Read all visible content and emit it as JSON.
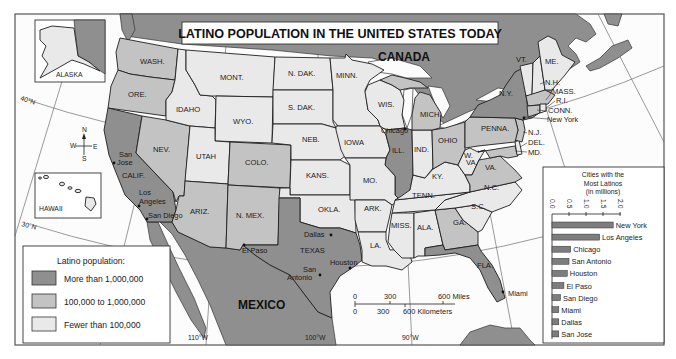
{
  "map": {
    "title": "LATINO POPULATION IN THE UNITED STATES TODAY",
    "countries": {
      "canada": "CANADA",
      "mexico": "MEXICO"
    },
    "insets": {
      "alaska": "ALASKA",
      "hawaii": "HAWAII"
    },
    "compass": {
      "n": "N",
      "s": "S",
      "e": "E",
      "w": "W"
    },
    "graticule": {
      "lat40": "40°N",
      "lat30": "30°N",
      "lon110": "110°W",
      "lon100": "100°W",
      "lon90": "90°W"
    },
    "states": {
      "WA": {
        "label": "WASH.",
        "category": "medium"
      },
      "OR": {
        "label": "ORE.",
        "category": "medium"
      },
      "CA": {
        "label": "CALIF.",
        "category": "high"
      },
      "NV": {
        "label": "NEV.",
        "category": "medium"
      },
      "ID": {
        "label": "IDAHO",
        "category": "low"
      },
      "MT": {
        "label": "MONT.",
        "category": "low"
      },
      "WY": {
        "label": "WYO.",
        "category": "low"
      },
      "UT": {
        "label": "UTAH",
        "category": "low"
      },
      "CO": {
        "label": "COLO.",
        "category": "medium"
      },
      "AZ": {
        "label": "ARIZ.",
        "category": "medium"
      },
      "NM": {
        "label": "N. MEX.",
        "category": "medium"
      },
      "ND": {
        "label": "N. DAK.",
        "category": "low"
      },
      "SD": {
        "label": "S. DAK.",
        "category": "low"
      },
      "NE": {
        "label": "NEB.",
        "category": "low"
      },
      "KS": {
        "label": "KANS.",
        "category": "low"
      },
      "OK": {
        "label": "OKLA.",
        "category": "low"
      },
      "TX": {
        "label": "TEXAS",
        "category": "high"
      },
      "MN": {
        "label": "MINN.",
        "category": "low"
      },
      "IA": {
        "label": "IOWA",
        "category": "low"
      },
      "MO": {
        "label": "MO.",
        "category": "low"
      },
      "AR": {
        "label": "ARK.",
        "category": "low"
      },
      "LA": {
        "label": "LA.",
        "category": "low"
      },
      "WI": {
        "label": "WIS.",
        "category": "low"
      },
      "IL": {
        "label": "ILL.",
        "category": "high"
      },
      "MI": {
        "label": "MICH.",
        "category": "medium"
      },
      "IN": {
        "label": "IND.",
        "category": "low"
      },
      "OH": {
        "label": "OHIO",
        "category": "medium"
      },
      "KY": {
        "label": "KY.",
        "category": "low"
      },
      "TN": {
        "label": "TENN.",
        "category": "low"
      },
      "MS": {
        "label": "MISS.",
        "category": "low"
      },
      "AL": {
        "label": "ALA.",
        "category": "low"
      },
      "GA": {
        "label": "GA.",
        "category": "medium"
      },
      "FL": {
        "label": "FLA.",
        "category": "high"
      },
      "SC": {
        "label": "S.C.",
        "category": "low"
      },
      "NC": {
        "label": "N.C.",
        "category": "low"
      },
      "VA": {
        "label": "VA.",
        "category": "medium"
      },
      "WV": {
        "label": "W.",
        "label2": "VA.",
        "category": "low"
      },
      "MD": {
        "label": "MD.",
        "category": "medium"
      },
      "DE": {
        "label": "DEL.",
        "category": "low"
      },
      "NJ": {
        "label": "N.J.",
        "category": "medium"
      },
      "PA": {
        "label": "PENNA.",
        "category": "medium"
      },
      "NY": {
        "label": "N.Y.",
        "category": "high"
      },
      "VT": {
        "label": "VT.",
        "category": "low"
      },
      "NH": {
        "label": "N.H.",
        "category": "low"
      },
      "ME": {
        "label": "ME.",
        "category": "low"
      },
      "MA": {
        "label": "MASS.",
        "category": "medium"
      },
      "RI": {
        "label": "R.I.",
        "category": "low"
      },
      "CT": {
        "label": "CONN.",
        "category": "medium"
      },
      "AK": {
        "category": "low"
      }
    },
    "cities": {
      "new_york": "New York",
      "chicago": "Chicago",
      "san_jose": [
        "San",
        "Jose"
      ],
      "los_angeles": [
        "Los",
        "Angeles"
      ],
      "san_diego": "San Diego",
      "el_paso": "El Paso",
      "dallas": "Dallas",
      "san_antonio": [
        "San",
        "Antonio"
      ],
      "houston": "Houston",
      "miami": "Miami"
    },
    "scale_bar": {
      "miles": [
        "0",
        "300",
        "600 Miles"
      ],
      "kilometers": [
        "0",
        "300",
        "600 Kilometers"
      ]
    }
  },
  "legend": {
    "title": "Latino population:",
    "items": [
      {
        "label": "More than 1,000,000",
        "category": "high",
        "color": "#8f8f8f"
      },
      {
        "label": "100,000 to 1,000,000",
        "category": "medium",
        "color": "#c3c3c3"
      },
      {
        "label": "Fewer than 100,000",
        "category": "low",
        "color": "#e9e9e9"
      }
    ]
  },
  "inset_chart": {
    "title_lines": [
      "Cities with the",
      "Most Latinos",
      "(in millions)"
    ],
    "ticks": [
      "0.0",
      "0.5",
      "1.0",
      "1.5",
      "2.0"
    ]
  },
  "chart_data": {
    "type": "bar",
    "orientation": "horizontal",
    "title": "Cities with the Most Latinos (in millions)",
    "categories": [
      "New York",
      "Los Angeles",
      "Chicago",
      "San Antonio",
      "Houston",
      "El Paso",
      "San Diego",
      "Miami",
      "Dallas",
      "San Jose"
    ],
    "values": [
      1.8,
      1.4,
      0.55,
      0.5,
      0.45,
      0.35,
      0.25,
      0.2,
      0.2,
      0.2
    ],
    "xlabel": "in millions",
    "xlim": [
      0,
      2.0
    ],
    "xticks": [
      0.0,
      0.5,
      1.0,
      1.5,
      2.0
    ],
    "grid": false
  }
}
